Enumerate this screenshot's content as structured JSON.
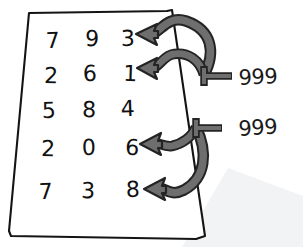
{
  "scene": {
    "title": "Handwritten digit grid with two 999 callout annotations",
    "width": 303,
    "height": 247,
    "background_color": "#ffffff"
  },
  "paper": {
    "name": "paper-sheet",
    "outline_color": "#141414",
    "fill_color": "#ffffff",
    "shadow_color": "#f2f3f5"
  },
  "grid": {
    "rows": [
      {
        "row_label": "row-1",
        "cells": [
          "7",
          "9",
          "3"
        ]
      },
      {
        "row_label": "row-2",
        "cells": [
          "2",
          "6",
          "1"
        ]
      },
      {
        "row_label": "row-3",
        "cells": [
          "5",
          "8",
          "4"
        ]
      },
      {
        "row_label": "row-4",
        "cells": [
          "2",
          "0",
          "6"
        ]
      },
      {
        "row_label": "row-5",
        "cells": [
          "7",
          "3",
          "8"
        ]
      }
    ]
  },
  "annotations": [
    {
      "name": "callout-upper",
      "label": "999",
      "targets": [
        "3",
        "1"
      ],
      "target_rows": [
        1,
        2
      ],
      "arrow_color": "#6e6e6e",
      "arrow_outline_color": "#242424"
    },
    {
      "name": "callout-lower",
      "label": "999",
      "targets": [
        "6",
        "8"
      ],
      "target_rows": [
        4,
        5
      ],
      "arrow_color": "#6e6e6e",
      "arrow_outline_color": "#242424"
    }
  ],
  "colors": {
    "ink": "#111111",
    "arrow_fill": "#6e6e6e",
    "arrow_stroke": "#242424",
    "paper_line": "#141414",
    "shadow": "#f2f3f5"
  }
}
